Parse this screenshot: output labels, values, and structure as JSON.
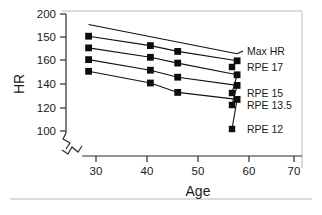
{
  "chart_data": {
    "type": "line",
    "title": "",
    "xlabel": "Age",
    "ylabel": "HR",
    "xlim": [
      25,
      72
    ],
    "ylim": [
      95,
      205
    ],
    "grid": false,
    "legend_position": "right",
    "axis_break_x": true,
    "axis_break_y": true,
    "xticks": [
      30,
      40,
      50,
      60,
      70
    ],
    "xtick_labels": [
      "30",
      "40",
      "50",
      "60",
      "70"
    ],
    "yticks": [
      200,
      180,
      160,
      140,
      120,
      100
    ],
    "ytick_labels": [
      "200",
      "150",
      "160",
      "140",
      "120",
      "100"
    ],
    "series": [
      {
        "name": "Max HR",
        "label": "Max HR",
        "markers": false,
        "x": [
          28.5,
          58.5
        ],
        "values": [
          191,
          166
        ]
      },
      {
        "name": "RPE 17",
        "label": "RPE 17",
        "markers": true,
        "x": [
          28.5,
          41.0,
          46.5,
          58.5
        ],
        "values": [
          181,
          173,
          168,
          160
        ]
      },
      {
        "name": "RPE 15",
        "label": "RPE 15",
        "markers": true,
        "x": [
          28.5,
          41.0,
          46.5,
          58.5
        ],
        "values": [
          171,
          163,
          158,
          148
        ]
      },
      {
        "name": "RPE 13.5",
        "label": "RPE 13.5",
        "markers": true,
        "x": [
          28.5,
          41.0,
          46.5,
          58.5
        ],
        "values": [
          161,
          152,
          146,
          139
        ]
      },
      {
        "name": "RPE 12",
        "label": "RPE 12",
        "markers": true,
        "x": [
          28.5,
          41.0,
          46.5,
          58.5
        ],
        "values": [
          151,
          141,
          133,
          127
        ]
      }
    ],
    "legend_entries": [
      {
        "label": "Max HR"
      },
      {
        "label": "RPE 17"
      },
      {
        "label": "RPE 15"
      },
      {
        "label": "RPE 13.5"
      },
      {
        "label": "RPE 12"
      }
    ]
  }
}
